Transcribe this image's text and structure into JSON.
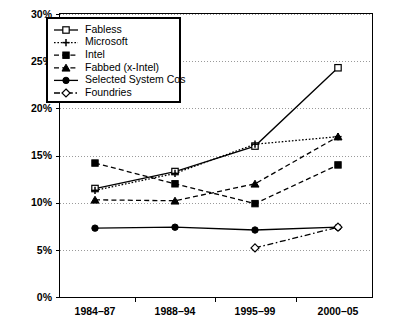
{
  "chart_data": {
    "type": "line",
    "title": "",
    "subtitle": "",
    "xlabel": "",
    "ylabel": "",
    "categories": [
      "1984–87",
      "1988–94",
      "1995–99",
      "2000–05"
    ],
    "ylim": [
      0,
      30
    ],
    "ytick_values": [
      0,
      5,
      10,
      15,
      20,
      25,
      30
    ],
    "ytick_labels": [
      "0%",
      "5%",
      "10%",
      "15%",
      "20%",
      "25%",
      "30%"
    ],
    "grid": true,
    "grid_axis": "y",
    "legend_position": "top-left",
    "series": [
      {
        "name": "Fabless",
        "values": [
          11.5,
          13.3,
          16.0,
          24.3
        ],
        "marker": "open-square",
        "linestyle": "solid"
      },
      {
        "name": "Microsoft",
        "values": [
          11.3,
          13.1,
          16.2,
          17.0
        ],
        "marker": "plus",
        "linestyle": "dotted"
      },
      {
        "name": "Intel",
        "values": [
          14.2,
          12.0,
          9.9,
          14.0
        ],
        "marker": "filled-square",
        "linestyle": "dashed"
      },
      {
        "name": "Fabbed (x-Intel)",
        "values": [
          10.3,
          10.2,
          12.0,
          17.0
        ],
        "marker": "filled-triangle",
        "linestyle": "dashed"
      },
      {
        "name": "Selected System Cos",
        "values": [
          7.3,
          7.4,
          7.1,
          7.4
        ],
        "marker": "filled-circle",
        "linestyle": "solid"
      },
      {
        "name": "Foundries",
        "values": [
          null,
          null,
          5.2,
          7.4
        ],
        "marker": "open-diamond",
        "linestyle": "dash-dot"
      }
    ]
  },
  "legend": {
    "entries": [
      {
        "label": "Fabless"
      },
      {
        "label": "Microsoft"
      },
      {
        "label": "Intel"
      },
      {
        "label": "Fabbed (x-Intel)"
      },
      {
        "label": "Selected System Cos"
      },
      {
        "label": "Foundries"
      }
    ]
  },
  "axes": {
    "y_labels": [
      "30%",
      "25%",
      "20%",
      "15%",
      "10%",
      "5%",
      "0%"
    ],
    "x_labels": [
      "1984–87",
      "1988–94",
      "1995–99",
      "2000–05"
    ]
  },
  "colors": {
    "ink": "#000000",
    "grid": "#9a9a9a",
    "background": "#ffffff"
  }
}
